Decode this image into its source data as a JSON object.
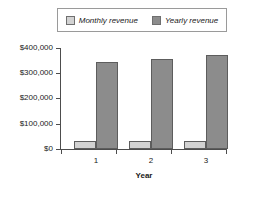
{
  "chart_data": {
    "type": "bar",
    "title": "",
    "xlabel": "Year",
    "ylabel": "",
    "categories": [
      "1",
      "2",
      "3"
    ],
    "series": [
      {
        "name": "Monthly revenue",
        "values": [
          30000,
          30000,
          31000
        ],
        "color": "#d2d2d2"
      },
      {
        "name": "Yearly revenue",
        "values": [
          345000,
          358000,
          372000
        ],
        "color": "#8c8c8c"
      }
    ],
    "ylim": [
      0,
      400000
    ],
    "ytick_values": [
      0,
      100000,
      200000,
      300000,
      400000
    ],
    "ytick_labels": [
      "$0",
      "$100,000",
      "$200,000",
      "$300,000",
      "$400,000"
    ],
    "grid": false,
    "legend_position": "top"
  },
  "legend": {
    "entries": [
      {
        "label": "Monthly revenue"
      },
      {
        "label": "Yearly revenue"
      }
    ]
  },
  "axes": {
    "x_title": "Year"
  }
}
